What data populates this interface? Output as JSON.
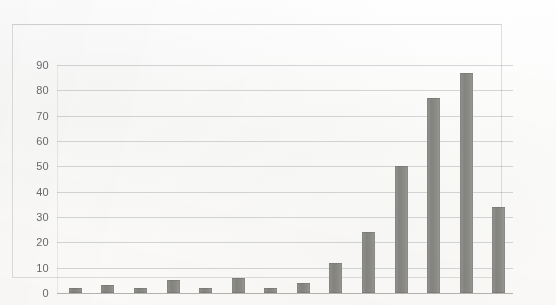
{
  "chart_data": {
    "type": "bar",
    "title": "",
    "subtitle": "",
    "xlabel": "",
    "ylabel": "",
    "categories": [
      "2010",
      "2011",
      "2012",
      "2013",
      "2014",
      "2015",
      "2016",
      "2017",
      "2018",
      "2019",
      "2020",
      "2021",
      "2022",
      "2023"
    ],
    "values": [
      2,
      3,
      2,
      5,
      2,
      6,
      2,
      4,
      12,
      24,
      50,
      77,
      87,
      34
    ],
    "series": [
      {
        "name": "Publications",
        "values": [
          2,
          3,
          2,
          5,
          2,
          6,
          2,
          4,
          12,
          24,
          50,
          77,
          87,
          34
        ]
      }
    ],
    "ylim": [
      0,
      90
    ],
    "ytick_labels": [
      "0",
      "10",
      "20",
      "30",
      "40",
      "50",
      "60",
      "70",
      "80",
      "90"
    ],
    "ytick_values": [
      0,
      10,
      20,
      30,
      40,
      50,
      60,
      70,
      80,
      90
    ],
    "xtick_labels": [
      "2010",
      "2011",
      "2012",
      "2013",
      "2014",
      "2015",
      "2016",
      "2017",
      "2018",
      "2019",
      "2020",
      "2021",
      "2022",
      "2023"
    ],
    "grid": "horizontal",
    "legend": "none",
    "bar_color": "#8b8b86",
    "gridline_color": "#9aa0a6",
    "axis_text_color": "#525252",
    "background_color": "#fdfdfc",
    "annotations": []
  }
}
